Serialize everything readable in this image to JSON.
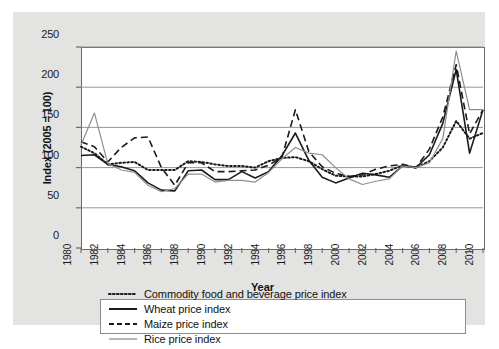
{
  "chart_data": {
    "type": "line",
    "title": "",
    "xlabel": "Year",
    "ylabel": "Index (2005 = 100)",
    "xlim": [
      1980,
      2010
    ],
    "ylim": [
      0,
      250
    ],
    "yticks": [
      0,
      50,
      100,
      150,
      200,
      250
    ],
    "xticks": [
      1980,
      1982,
      1984,
      1986,
      1988,
      1990,
      1992,
      1994,
      1996,
      1998,
      2000,
      2002,
      2004,
      2006,
      2008,
      2010
    ],
    "x": [
      1980,
      1981,
      1982,
      1983,
      1984,
      1985,
      1986,
      1987,
      1988,
      1989,
      1990,
      1991,
      1992,
      1993,
      1994,
      1995,
      1996,
      1997,
      1998,
      1999,
      2000,
      2001,
      2002,
      2003,
      2004,
      2005,
      2006,
      2007,
      2008,
      2009,
      2010
    ],
    "grid": "horizontal",
    "legend_position": "bottom",
    "series": [
      {
        "name": "Commodity food and beverage price index",
        "style": "dotted",
        "color": "#1a1a1a",
        "values": [
          126,
          118,
          104,
          106,
          107,
          97,
          97,
          97,
          108,
          107,
          104,
          102,
          102,
          100,
          108,
          112,
          113,
          108,
          98,
          90,
          89,
          89,
          92,
          96,
          103,
          100,
          108,
          125,
          158,
          136,
          143
        ]
      },
      {
        "name": "Maize price index",
        "style": "dashed",
        "color": "#1a1a1a",
        "values": [
          132,
          126,
          107,
          125,
          137,
          138,
          100,
          78,
          106,
          106,
          95,
          95,
          96,
          97,
          103,
          113,
          172,
          120,
          101,
          93,
          89,
          91,
          98,
          102,
          104,
          100,
          123,
          163,
          228,
          142,
          172
        ]
      },
      {
        "name": "Wheat price index",
        "style": "solid",
        "color": "#1a1a1a",
        "values": [
          115,
          116,
          104,
          101,
          96,
          81,
          72,
          71,
          96,
          97,
          85,
          85,
          95,
          87,
          95,
          115,
          143,
          109,
          88,
          81,
          87,
          93,
          91,
          88,
          102,
          100,
          116,
          155,
          222,
          118,
          172
        ]
      },
      {
        "name": "Rice price index",
        "style": "solid",
        "color": "#8f8f8f",
        "values": [
          128,
          168,
          105,
          97,
          94,
          78,
          70,
          74,
          92,
          92,
          82,
          84,
          84,
          82,
          94,
          111,
          125,
          118,
          116,
          100,
          86,
          79,
          83,
          86,
          102,
          100,
          106,
          136,
          245,
          172,
          172
        ]
      }
    ]
  },
  "axes": {
    "ylabel": "Index (2005 = 100)",
    "xlabel": "Year",
    "ytick_labels": [
      "250",
      "200",
      "150",
      "100",
      "50",
      "0"
    ],
    "xtick_labels": [
      "1980",
      "1982",
      "1984",
      "1986",
      "1988",
      "1990",
      "1992",
      "1994",
      "1996",
      "1998",
      "2000",
      "2002",
      "2004",
      "2006",
      "2008",
      "2010"
    ]
  },
  "legend": {
    "entries": [
      {
        "label": "Commodity food and beverage price index",
        "style": "dotted",
        "color": "#1a1a1a"
      },
      {
        "label": "Wheat price index",
        "style": "solid",
        "color": "#1a1a1a"
      },
      {
        "label": "Maize price index",
        "style": "dashed",
        "color": "#1a1a1a"
      },
      {
        "label": "Rice price index",
        "style": "solid",
        "color": "#8f8f8f"
      }
    ]
  },
  "colors": {
    "panel_background": "#e3e3e1",
    "plot_background": "#ffffff",
    "axis": "#6b6b6b",
    "gridline": "#8a8a8a",
    "primary_line": "#1a1a1a",
    "secondary_line": "#8f8f8f"
  }
}
